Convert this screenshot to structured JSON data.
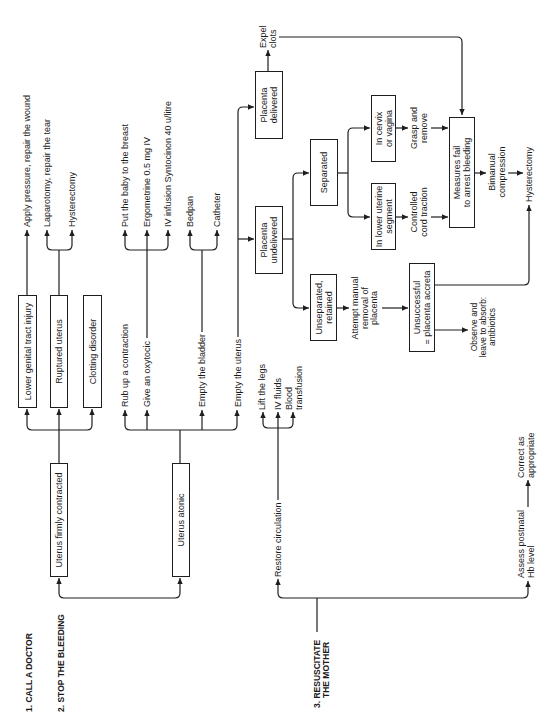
{
  "colors": {
    "line_color": "#1e1e1e",
    "text_color": "#1a1a1a",
    "background": "#ffffff"
  },
  "headings": {
    "call_doctor": "1. CALL A DOCTOR",
    "stop_bleeding": "2. STOP THE BLEEDING",
    "resuscitate_line1": "3. RESUSCITATE",
    "resuscitate_line2": "THE MOTHER"
  },
  "boxes": {
    "uterus_firmly_contracted": "Uterus firmly contracted",
    "uterus_atonic": "Uterus atonic",
    "lower_genital_tract_injury": "Lower genital tract injury",
    "ruptured_uterus": "Ruptured uterus",
    "clotting_disorder": "Clotting disorder",
    "placenta_delivered": "Placenta\ndelivered",
    "placenta_undelivered": "Placenta\nundelivered",
    "separated": "Separated",
    "unseparated_retained": "Unseparated,\nretained",
    "in_cervix_or_vagina": "In cervix\nor vagina",
    "in_lower_uterine_segment": "In lower uterine\nsegment",
    "measures_fail": "Measures fail\nto arrest bleeding",
    "unsuccessful_accreta": "Unsuccessful\n= placenta accreta"
  },
  "labels": {
    "apply_pressure": "Apply pressure, repair the wound",
    "laparotomy": "Laparotomy, repair the tear",
    "hysterectomy_ruptured": "Hysterectomy",
    "put_baby_to_breast": "Put the baby to the breast",
    "ergometrine": "Ergometrine 0.5 mg IV",
    "iv_infusion_syntocinon": "IV infusion Syntocinon 40 u/litre",
    "bedpan": "Bedpan",
    "catheter": "Catheter",
    "rub_up_contraction": "Rub up a contraction",
    "give_oxytocic": "Give an oxytocic",
    "empty_bladder": "Empty the bladder",
    "empty_uterus": "Empty the uterus",
    "expel_clots": "Expel\nclots",
    "attempt_manual_removal": "Attempt manual\nremoval of\nplacenta",
    "grasp_and_remove": "Grasp and\nremove",
    "controlled_cord_traction": "Controlled\ncord traction",
    "bimanual_compression": "Bimanual\ncompression",
    "hysterectomy_final": "Hysterectomy",
    "observe_absorb": "Observe and\nleave to absorb:\nantibiotics",
    "restore_circulation": "Restore circulation",
    "lift_legs": "Lift the legs",
    "iv_fluids": "IV fluids",
    "blood_transfusion": "Blood\ntransfusion",
    "assess_hb": "Assess postnatal\nHb level",
    "correct_as_appropriate": "Correct as\nappropriate"
  }
}
